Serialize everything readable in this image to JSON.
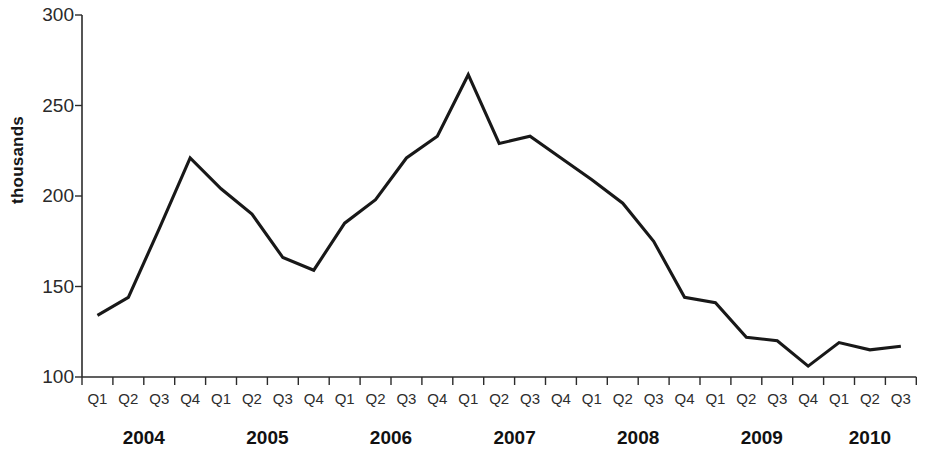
{
  "chart_data": {
    "type": "line",
    "title": "",
    "xlabel": "",
    "ylabel": "thousands",
    "ylim": [
      100,
      300
    ],
    "yticks": [
      100,
      150,
      200,
      250,
      300
    ],
    "ytick_labels": [
      "100",
      "150",
      "200",
      "250",
      "300"
    ],
    "grid": false,
    "legend": "none",
    "categories": [
      "Q1",
      "Q2",
      "Q3",
      "Q4",
      "Q1",
      "Q2",
      "Q3",
      "Q4",
      "Q1",
      "Q2",
      "Q3",
      "Q4",
      "Q1",
      "Q2",
      "Q3",
      "Q4",
      "Q1",
      "Q2",
      "Q3",
      "Q4",
      "Q1",
      "Q2",
      "Q3",
      "Q4",
      "Q1",
      "Q2",
      "Q3"
    ],
    "year_groups": [
      {
        "year": "2004",
        "start_index": 0,
        "count": 4
      },
      {
        "year": "2005",
        "start_index": 4,
        "count": 4
      },
      {
        "year": "2006",
        "start_index": 8,
        "count": 4
      },
      {
        "year": "2007",
        "start_index": 12,
        "count": 4
      },
      {
        "year": "2008",
        "start_index": 16,
        "count": 4
      },
      {
        "year": "2009",
        "start_index": 20,
        "count": 4
      },
      {
        "year": "2010",
        "start_index": 24,
        "count": 3
      }
    ],
    "values": [
      134,
      144,
      182,
      221,
      204,
      190,
      166,
      159,
      185,
      198,
      221,
      233,
      267,
      229,
      233,
      221,
      209,
      196,
      175,
      144,
      141,
      122,
      120,
      106,
      119,
      115,
      117
    ],
    "series_color": "#181818",
    "series_name": ""
  }
}
